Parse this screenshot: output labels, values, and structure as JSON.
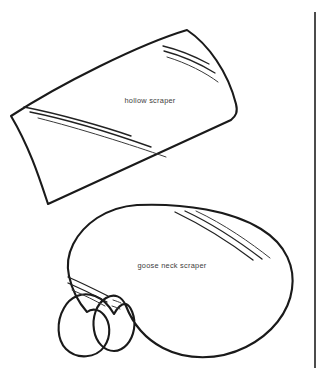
{
  "figure": {
    "background_color": "#ffffff",
    "ink_color": "#1a1a1a",
    "label_color": "#3c3c3c",
    "width": 326,
    "height": 380,
    "shapes": [
      {
        "id": "hollow-scraper",
        "label": "hollow scraper",
        "label_x": 150,
        "label_y": 103,
        "description": "curved trough-shaped blade drawn in perspective"
      },
      {
        "id": "goose-neck-scraper",
        "label": "goose neck scraper",
        "label_x": 172,
        "label_y": 268,
        "description": "kidney / bean shaped blade with concave notch"
      }
    ],
    "rule": {
      "name": "vertical rule",
      "x": 315,
      "y1": 12,
      "y2": 368
    }
  }
}
